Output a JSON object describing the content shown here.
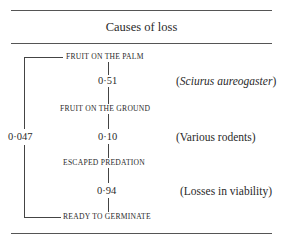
{
  "table": {
    "header": "Causes of loss",
    "overall_probability": "0·047",
    "stages": [
      {
        "label": "FRUIT ON THE PALM"
      },
      {
        "label": "FRUIT ON THE GROUND"
      },
      {
        "label": "ESCAPED PREDATION"
      },
      {
        "label": "READY TO GERMINATE"
      }
    ],
    "transitions": [
      {
        "probability": "0·51",
        "cause_open": "(",
        "cause_text": "Sciurus aureogaster",
        "cause_close": ")",
        "cause_italic": true
      },
      {
        "probability": "0·10",
        "cause_open": "",
        "cause_text": "(Various rodents)",
        "cause_close": "",
        "cause_italic": false
      },
      {
        "probability": "0·94",
        "cause_open": "",
        "cause_text": "(Losses in viability)",
        "cause_close": "",
        "cause_italic": false
      }
    ]
  }
}
